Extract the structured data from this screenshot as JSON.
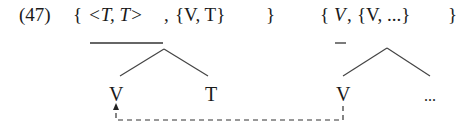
{
  "example": {
    "number": "(47)",
    "left_set": {
      "open": "{",
      "pair": "<T, T>",
      "sep": ", ",
      "inner": "{V, T}",
      "close": "}"
    },
    "right_set": {
      "open": "{",
      "head": "V",
      "sep": ", ",
      "inner": "{V, ...}",
      "close": "}"
    }
  },
  "left_tree": {
    "leaves": [
      "V",
      "T"
    ]
  },
  "right_tree": {
    "leaves": [
      "V",
      "..."
    ]
  },
  "movement": {
    "style": "dashed",
    "from": "right_tree.V",
    "to": "left_tree.V",
    "arrow": "up"
  }
}
